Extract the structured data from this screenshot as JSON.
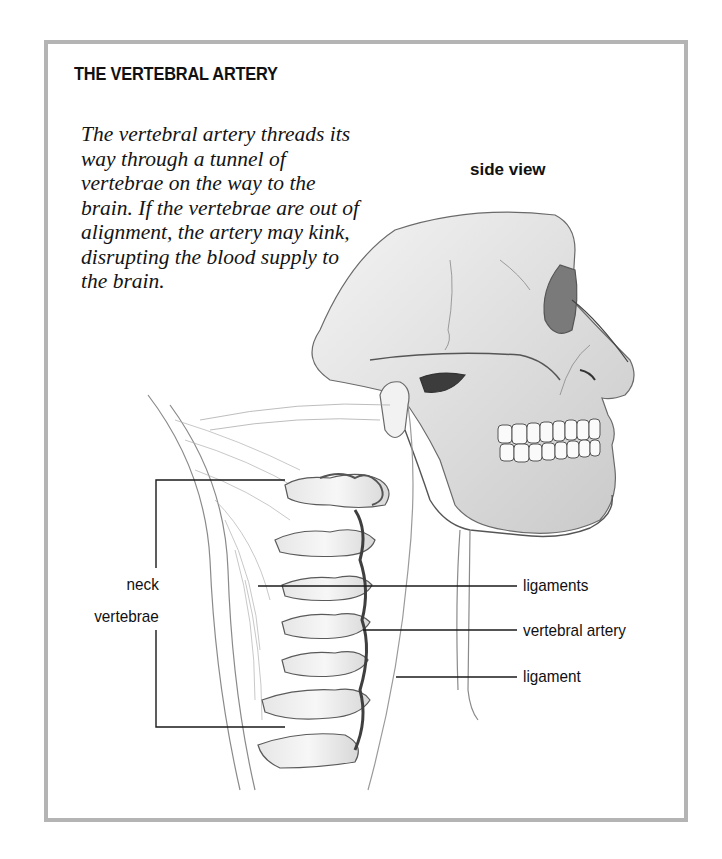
{
  "figure": {
    "title": "THE VERTEBRAL ARTERY",
    "caption_lines": [
      "The vertebral artery threads its",
      "way through a tunnel of",
      "vertebrae on the way to the",
      "brain. If the vertebrae are out of",
      "alignment, the artery may kink,",
      "disrupting the blood supply to",
      "the brain."
    ],
    "view_label": "side view"
  },
  "labels": {
    "left": {
      "line1": "neck",
      "line2": "vertebrae"
    },
    "right": [
      {
        "text": "ligaments"
      },
      {
        "text": "vertebral artery"
      },
      {
        "text": "ligament"
      }
    ]
  },
  "colors": {
    "frame_border": "#b4b4b4",
    "text": "#111111",
    "illustration_line": "#5a5a5a",
    "illustration_shade": "#9a9a9a"
  }
}
